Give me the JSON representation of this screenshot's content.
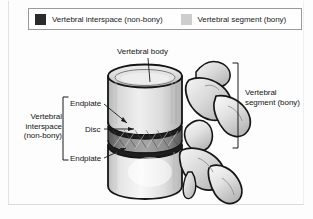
{
  "figure": {
    "title_kind": "anatomical-diagram"
  },
  "legend": {
    "items": [
      {
        "label": "Vertebral interspace (non-bony)",
        "swatch_color": "#2b2b2b",
        "swatch_name": "dark-swatch"
      },
      {
        "label": "Vertebral segment (bony)",
        "swatch_color": "#cdcdcd",
        "swatch_name": "light-swatch"
      }
    ]
  },
  "labels": {
    "vertebral_body": "Vertebral body",
    "interspace": "Vertebral interspace (non-bony)",
    "endplate_top": "Endplate",
    "disc": "Disc",
    "endplate_bottom": "Endplate",
    "segment": "Vertebral segment (bony)"
  },
  "colors": {
    "bone_light": "#e9e9e9",
    "bone_mid": "#c9c9c9",
    "bone_shadow": "#a8a8a8",
    "disc_dark": "#3a3a3a",
    "outline": "#161616",
    "text": "#151515",
    "frame": "#9a9a9a",
    "background": "#fdfdfd"
  }
}
